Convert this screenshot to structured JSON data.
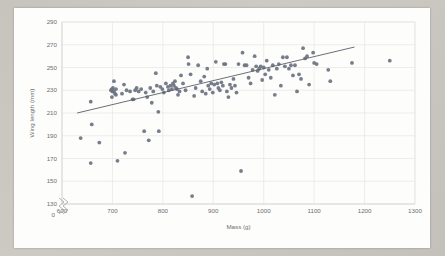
{
  "chart_data": {
    "type": "scatter",
    "title": "",
    "xlabel": "Mass (g)",
    "ylabel": "Wing length (mm)",
    "xlim": [
      600,
      1300
    ],
    "ylim": [
      130,
      290
    ],
    "xticks": [
      600,
      700,
      800,
      900,
      1000,
      1100,
      1200,
      1300
    ],
    "yticks": [
      130,
      150,
      170,
      190,
      210,
      230,
      250,
      270,
      290
    ],
    "y_axis_break": true,
    "y_axis_break_label": "0",
    "grid": true,
    "legend": false,
    "marker_color": "#6b7280",
    "trendline_color": "#5a5f68",
    "gridline_color": "#e2e2e2",
    "background_color": "#fdfdfc",
    "page_background_color": "#c7c4be",
    "trendline": {
      "x": [
        630,
        1180
      ],
      "y": [
        210,
        268
      ]
    },
    "points": [
      [
        637,
        188
      ],
      [
        657,
        220
      ],
      [
        657,
        166
      ],
      [
        659,
        200
      ],
      [
        674,
        184
      ],
      [
        697,
        230
      ],
      [
        699,
        231
      ],
      [
        700,
        229
      ],
      [
        701,
        232
      ],
      [
        703,
        229
      ],
      [
        705,
        227
      ],
      [
        707,
        231
      ],
      [
        699,
        224
      ],
      [
        703,
        238
      ],
      [
        707,
        226
      ],
      [
        710,
        168
      ],
      [
        719,
        227
      ],
      [
        723,
        235
      ],
      [
        725,
        175
      ],
      [
        728,
        230
      ],
      [
        735,
        229
      ],
      [
        740,
        222
      ],
      [
        742,
        222
      ],
      [
        745,
        230
      ],
      [
        748,
        232
      ],
      [
        752,
        229
      ],
      [
        757,
        231
      ],
      [
        763,
        194
      ],
      [
        766,
        228
      ],
      [
        769,
        224
      ],
      [
        772,
        186
      ],
      [
        775,
        232
      ],
      [
        778,
        219
      ],
      [
        781,
        229
      ],
      [
        786,
        245
      ],
      [
        788,
        234
      ],
      [
        791,
        211
      ],
      [
        792,
        194
      ],
      [
        795,
        233
      ],
      [
        799,
        231
      ],
      [
        802,
        228
      ],
      [
        806,
        236
      ],
      [
        810,
        233
      ],
      [
        812,
        230
      ],
      [
        815,
        234
      ],
      [
        818,
        231
      ],
      [
        820,
        236
      ],
      [
        822,
        234
      ],
      [
        824,
        238
      ],
      [
        826,
        232
      ],
      [
        828,
        231
      ],
      [
        830,
        226
      ],
      [
        833,
        229
      ],
      [
        836,
        243
      ],
      [
        840,
        236
      ],
      [
        845,
        230
      ],
      [
        850,
        259
      ],
      [
        851,
        253
      ],
      [
        855,
        244
      ],
      [
        858,
        137
      ],
      [
        862,
        225
      ],
      [
        865,
        232
      ],
      [
        870,
        252
      ],
      [
        875,
        238
      ],
      [
        878,
        229
      ],
      [
        882,
        242
      ],
      [
        885,
        227
      ],
      [
        888,
        249
      ],
      [
        890,
        234
      ],
      [
        893,
        231
      ],
      [
        896,
        236
      ],
      [
        899,
        228
      ],
      [
        902,
        235
      ],
      [
        905,
        255
      ],
      [
        908,
        236
      ],
      [
        910,
        232
      ],
      [
        913,
        230
      ],
      [
        916,
        237
      ],
      [
        919,
        234
      ],
      [
        921,
        253
      ],
      [
        924,
        253
      ],
      [
        927,
        229
      ],
      [
        930,
        224
      ],
      [
        933,
        235
      ],
      [
        936,
        232
      ],
      [
        940,
        240
      ],
      [
        943,
        234
      ],
      [
        946,
        228
      ],
      [
        950,
        253
      ],
      [
        955,
        159
      ],
      [
        958,
        263
      ],
      [
        962,
        252
      ],
      [
        966,
        252
      ],
      [
        970,
        241
      ],
      [
        974,
        236
      ],
      [
        978,
        248
      ],
      [
        982,
        260
      ],
      [
        985,
        251
      ],
      [
        988,
        247
      ],
      [
        991,
        249
      ],
      [
        994,
        251
      ],
      [
        997,
        239
      ],
      [
        1000,
        250
      ],
      [
        1003,
        244
      ],
      [
        1006,
        256
      ],
      [
        1010,
        248
      ],
      [
        1014,
        241
      ],
      [
        1018,
        252
      ],
      [
        1022,
        226
      ],
      [
        1026,
        249
      ],
      [
        1030,
        253
      ],
      [
        1034,
        234
      ],
      [
        1038,
        259
      ],
      [
        1042,
        251
      ],
      [
        1046,
        259
      ],
      [
        1050,
        249
      ],
      [
        1054,
        252
      ],
      [
        1058,
        243
      ],
      [
        1062,
        252
      ],
      [
        1066,
        229
      ],
      [
        1070,
        244
      ],
      [
        1074,
        240
      ],
      [
        1078,
        267
      ],
      [
        1082,
        258
      ],
      [
        1086,
        260
      ],
      [
        1090,
        235
      ],
      [
        1098,
        263
      ],
      [
        1100,
        254
      ],
      [
        1105,
        253
      ],
      [
        1128,
        248
      ],
      [
        1132,
        238
      ],
      [
        1175,
        254
      ],
      [
        1250,
        256
      ]
    ]
  },
  "axis": {
    "x_title": "Mass (g)",
    "y_title": "Wing length (mm)",
    "x_tick_labels": [
      "600",
      "700",
      "800",
      "900",
      "1000",
      "1100",
      "1200",
      "1300"
    ],
    "y_tick_labels": [
      "130",
      "150",
      "170",
      "190",
      "210",
      "230",
      "250",
      "270",
      "290"
    ],
    "y_origin_label": "0"
  }
}
